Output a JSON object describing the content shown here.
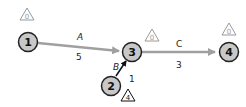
{
  "diagram": {
    "type": "activity-on-arrow network",
    "nodes": [
      {
        "id": "1",
        "label": "1",
        "slack": "0",
        "slack_color": "#9a9a9a"
      },
      {
        "id": "2",
        "label": "2",
        "slack": "4",
        "slack_color": "#111111"
      },
      {
        "id": "3",
        "label": "3",
        "slack": "0",
        "slack_color": "#9a9a9a"
      },
      {
        "id": "4",
        "label": "4",
        "slack": "0",
        "slack_color": "#9a9a9a"
      }
    ],
    "edges": [
      {
        "from": "1",
        "to": "3",
        "activity": "A",
        "duration": "5",
        "critical": true
      },
      {
        "from": "2",
        "to": "3",
        "activity": "B",
        "duration": "1",
        "critical": false
      },
      {
        "from": "3",
        "to": "4",
        "activity": "C",
        "duration": "3",
        "critical": true
      }
    ]
  },
  "colors": {
    "node_fill": "#c8c8c8",
    "node_stroke": "#222222",
    "critical_edge": "#a0a0a0",
    "noncritical_edge": "#111111"
  }
}
